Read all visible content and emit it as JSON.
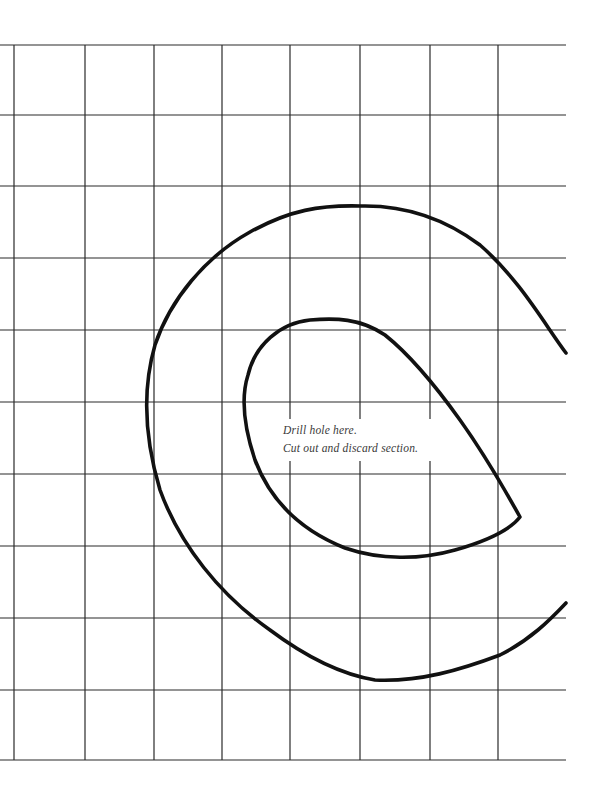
{
  "diagram": {
    "type": "cutting-template",
    "colors": {
      "background": "#ffffff",
      "grid": "#2a2a2a",
      "outline": "#111111",
      "note_text": "#3a3a3a"
    },
    "grid": {
      "x_lines": [
        14,
        85,
        154,
        222,
        290,
        360,
        430,
        498
      ],
      "y_lines": [
        45,
        115,
        186,
        258,
        330,
        402,
        474,
        546,
        618,
        690,
        760
      ],
      "x_start": 0,
      "x_end": 566
    },
    "note": {
      "line1": "Drill hole here.",
      "line2": "Cut out and discard section."
    }
  }
}
